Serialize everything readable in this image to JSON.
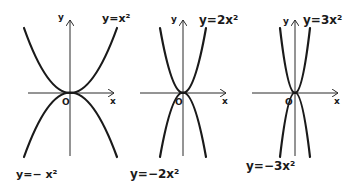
{
  "panels": [
    {
      "id": "a1",
      "origin_label": "O",
      "x_axis_label": "x",
      "y_axis_label": "y",
      "top_curve_label": "y=x²",
      "bottom_curve_label": "y=− x²",
      "coefficient": 1
    },
    {
      "id": "a2",
      "origin_label": "O",
      "x_axis_label": "x",
      "y_axis_label": "y",
      "top_curve_label": "y=2x²",
      "bottom_curve_label": "y=−2x²",
      "coefficient": 2
    },
    {
      "id": "a3",
      "origin_label": "O",
      "x_axis_label": "x",
      "y_axis_label": "y",
      "top_curve_label": "y=3x²",
      "bottom_curve_label": "y=−3x²",
      "coefficient": 3
    }
  ]
}
